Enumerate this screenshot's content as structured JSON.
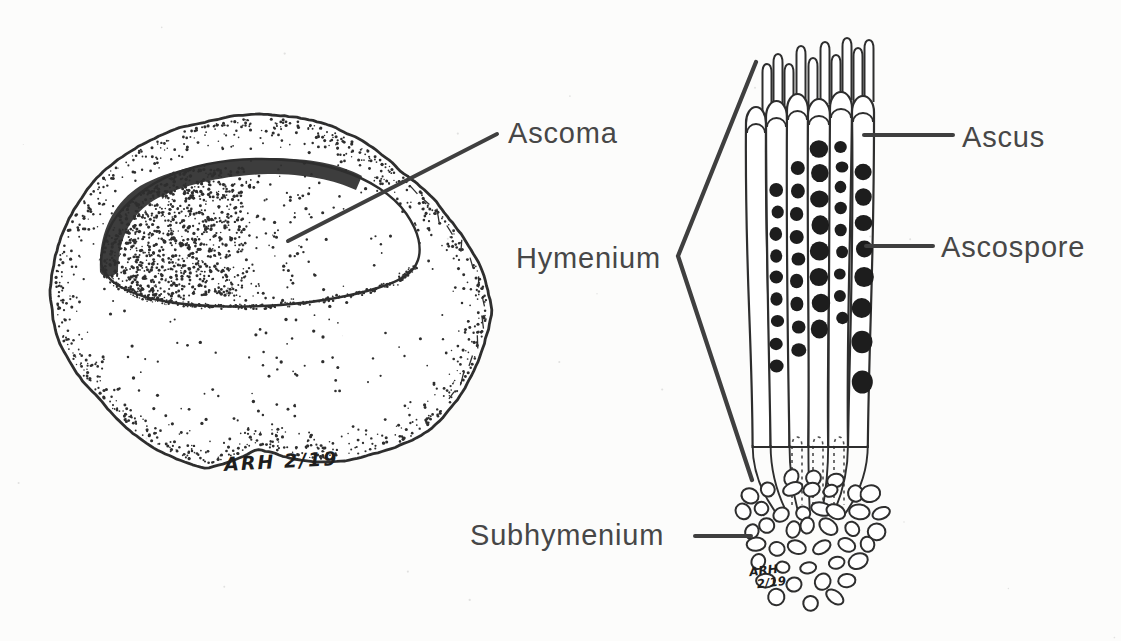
{
  "figure": {
    "type": "labeled-illustration",
    "labels": {
      "ascoma": "Ascoma",
      "ascus": "Ascus",
      "ascospore": "Ascospore",
      "hymenium": "Hymenium",
      "subhymenium": "Subhymenium"
    },
    "signatures": {
      "left": "ARH 2/19",
      "right_line1": "ARH",
      "right_line2": "2/19"
    },
    "colors": {
      "background": "#fcfcfb",
      "ink": "#2e2e2e",
      "spore_fill": "#1d1d1d",
      "label_text": "#474747",
      "leader_line": "#3f3f3f"
    }
  }
}
